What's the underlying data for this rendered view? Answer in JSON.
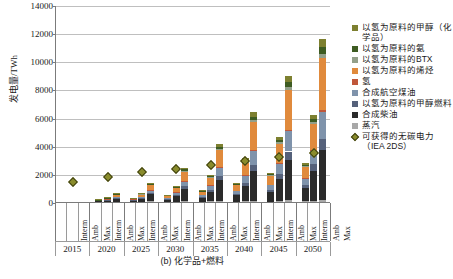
{
  "axis": {
    "ylabel": "发电量/TWh",
    "yticks": [
      "0",
      "2000",
      "4000",
      "6000",
      "8000",
      "10000",
      "12000",
      "14000"
    ],
    "ymin": 0,
    "ymax": 14000,
    "scenarios": [
      "Interm",
      "Amb",
      "Max"
    ],
    "years": [
      "2015",
      "2020",
      "2025",
      "2030",
      "2035",
      "2040",
      "2045",
      "2050"
    ]
  },
  "caption": "(b) 化学品+燃料",
  "legend": {
    "items": [
      {
        "label": "以氢为原料的甲醇（化学品）",
        "color": "#7d8030"
      },
      {
        "label": "以氢为原料的氨",
        "color": "#3e5c22"
      },
      {
        "label": "以氢为原料的BTX",
        "color": "#93a08a"
      },
      {
        "label": "以氢为原料的烯烃",
        "color": "#e08a3c"
      },
      {
        "label": "氢",
        "color": "#c0573a"
      },
      {
        "label": "合成航空煤油",
        "color": "#7f93ab"
      },
      {
        "label": "以氢为原料的甲醇燃料",
        "color": "#55617a"
      },
      {
        "label": "合成柴油",
        "color": "#2a2a2a"
      },
      {
        "label": "蒸汽",
        "color": "#a8a8a8"
      },
      {
        "label": "可获得的无碳电力（IEA 2DS）",
        "color": "#8a8c2c",
        "marker": "diamond"
      }
    ]
  },
  "chart_data": {
    "type": "bar",
    "subtype": "stacked-bar-grouped-with-scatter-overlay",
    "title": "",
    "xlabel": "",
    "ylabel": "发电量/TWh",
    "ylim": [
      0,
      14000
    ],
    "ytick_step": 2000,
    "grid": true,
    "legend_position": "right",
    "categories": [
      "2015",
      "2020",
      "2025",
      "2030",
      "2035",
      "2040",
      "2045",
      "2050"
    ],
    "subcategories": [
      "Interm",
      "Amb",
      "Max"
    ],
    "series": [
      {
        "name": "蒸汽",
        "color": "#a8a8a8",
        "values": {
          "Interm": [
            0,
            10,
            15,
            20,
            25,
            30,
            35,
            40
          ],
          "Amb": [
            0,
            15,
            25,
            35,
            45,
            55,
            65,
            75
          ],
          "Max": [
            0,
            25,
            40,
            60,
            80,
            100,
            120,
            140
          ]
        }
      },
      {
        "name": "合成柴油",
        "color": "#2a2a2a",
        "values": {
          "Interm": [
            0,
            60,
            110,
            180,
            300,
            450,
            700,
            950
          ],
          "Amb": [
            0,
            110,
            230,
            400,
            700,
            1100,
            1600,
            2150
          ],
          "Max": [
            0,
            230,
            520,
            900,
            1450,
            2100,
            2850,
            3550
          ]
        }
      },
      {
        "name": "以氢为原料的甲醇燃料",
        "color": "#55617a",
        "values": {
          "Interm": [
            0,
            10,
            20,
            35,
            60,
            95,
            150,
            200
          ],
          "Amb": [
            0,
            20,
            45,
            80,
            140,
            230,
            340,
            450
          ],
          "Max": [
            0,
            45,
            100,
            185,
            300,
            450,
            620,
            780
          ]
        }
      },
      {
        "name": "合成航空煤油",
        "color": "#7f93ab",
        "values": {
          "Interm": [
            0,
            15,
            35,
            70,
            120,
            210,
            330,
            450
          ],
          "Amb": [
            0,
            35,
            80,
            150,
            280,
            470,
            720,
            980
          ],
          "Max": [
            0,
            70,
            170,
            330,
            600,
            980,
            1450,
            1900
          ]
        }
      },
      {
        "name": "氢",
        "color": "#c0573a",
        "values": {
          "Interm": [
            0,
            2,
            5,
            8,
            12,
            18,
            25,
            35
          ],
          "Amb": [
            0,
            4,
            9,
            16,
            26,
            40,
            56,
            75
          ],
          "Max": [
            0,
            8,
            18,
            32,
            52,
            80,
            110,
            150
          ]
        }
      },
      {
        "name": "以氢为原料的烯烃",
        "color": "#e08a3c",
        "values": {
          "Interm": [
            0,
            35,
            70,
            130,
            230,
            400,
            600,
            820
          ],
          "Amb": [
            0,
            80,
            170,
            310,
            540,
            900,
            1350,
            1800
          ],
          "Max": [
            0,
            170,
            370,
            680,
            1180,
            1950,
            2800,
            3700
          ]
        }
      },
      {
        "name": "以氢为原料的BTX",
        "color": "#93a08a",
        "values": {
          "Interm": [
            0,
            3,
            6,
            11,
            18,
            30,
            45,
            60
          ],
          "Amb": [
            0,
            6,
            13,
            24,
            42,
            70,
            100,
            135
          ],
          "Max": [
            0,
            13,
            28,
            52,
            90,
            150,
            215,
            285
          ]
        }
      },
      {
        "name": "以氢为原料的氨",
        "color": "#3e5c22",
        "values": {
          "Interm": [
            0,
            5,
            10,
            18,
            30,
            50,
            75,
            100
          ],
          "Amb": [
            0,
            10,
            22,
            40,
            70,
            115,
            170,
            225
          ],
          "Max": [
            0,
            22,
            48,
            88,
            150,
            250,
            360,
            480
          ]
        }
      },
      {
        "name": "以氢为原料的甲醇（化学品）",
        "color": "#7d8030",
        "values": {
          "Interm": [
            0,
            6,
            13,
            23,
            38,
            62,
            92,
            125
          ],
          "Amb": [
            0,
            13,
            28,
            50,
            88,
            143,
            212,
            280
          ],
          "Max": [
            0,
            28,
            60,
            110,
            190,
            310,
            455,
            600
          ]
        }
      }
    ],
    "overlay": {
      "name": "可获得的无碳电力（IEA 2DS）",
      "type": "scatter",
      "marker": "diamond",
      "color": "#8a8c2c",
      "x": [
        "2015",
        "2020",
        "2025",
        "2030",
        "2035",
        "2040",
        "2045",
        "2050"
      ],
      "values": [
        1700,
        2050,
        2350,
        2600,
        2900,
        3150,
        3450,
        3750
      ]
    }
  }
}
